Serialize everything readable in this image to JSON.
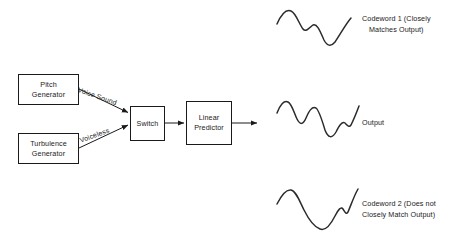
{
  "diagram": {
    "title_semantic": "speech-synthesis-block-diagram",
    "blocks": [
      {
        "id": "pitch",
        "line1": "Pitch",
        "line2": "Generator"
      },
      {
        "id": "turbulence",
        "line1": "Turbulence",
        "line2": "Generator"
      },
      {
        "id": "switch",
        "line1": "Switch",
        "line2": ""
      },
      {
        "id": "linear",
        "line1": "Linear",
        "line2": "Predictor"
      }
    ],
    "edge_labels": [
      {
        "id": "voice-sound",
        "text": "Voice Sound"
      },
      {
        "id": "voiceless",
        "text": "Voiceless"
      }
    ]
  },
  "waveforms": [
    {
      "id": "codeword-1",
      "label_line1": "Codeword 1 (Closely",
      "label_line2": "Matches Output)",
      "path": "M277,24 C281,15 286,9 291,11 C296,13 299,24 303,29 C306,33 310,27 313,25 C317,23 320,31 324,40 C327,46 331,47 335,42 C340,35 345,25 351,18"
    },
    {
      "id": "output",
      "label_line1": "Output",
      "label_line2": "",
      "path": "M277,113 C280,105 284,100 288,102 C292,104 294,113 297,119 C300,125 303,125 306,118 C309,111 312,106 316,108 C319,110 322,120 325,130 C328,138 332,139 336,132 C339,126 342,121 345,123 C347,125 349,128 351,125 C353,121 356,114 359,106"
    },
    {
      "id": "codeword-2",
      "label_line1": "Codeword 2 (Does not",
      "label_line2": "Closely Match Output)",
      "path": "M277,204 C281,196 286,189 291,190 C296,191 299,200 304,210 C309,220 314,227 320,229 C325,231 330,226 335,216 C338,210 341,206 343,209 C345,212 346,215 348,212 C351,205 354,196 358,189"
    }
  ],
  "colors": {
    "ink": "#1a1a1a",
    "background": "#ffffff"
  }
}
